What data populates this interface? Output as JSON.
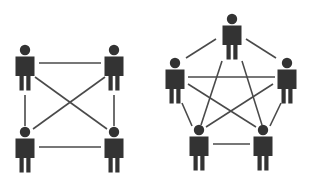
{
  "diagram": {
    "colors": {
      "figure": "#333333",
      "link": "#4a4a4a",
      "background": "#ffffff"
    },
    "groups": [
      {
        "name": "four-person-network",
        "nodes": [
          {
            "id": "A",
            "head_cx": 25,
            "head_cy": 50,
            "position": "top-left"
          },
          {
            "id": "B",
            "head_cx": 114,
            "head_cy": 50,
            "position": "top-right"
          },
          {
            "id": "C",
            "head_cx": 25,
            "head_cy": 132,
            "position": "bottom-left"
          },
          {
            "id": "D",
            "head_cx": 114,
            "head_cy": 132,
            "position": "bottom-right"
          }
        ],
        "links": [
          {
            "from": "A",
            "to": "B",
            "x1": 39,
            "y1": 63,
            "x2": 101,
            "y2": 63
          },
          {
            "from": "C",
            "to": "D",
            "x1": 39,
            "y1": 147,
            "x2": 101,
            "y2": 147
          },
          {
            "from": "A",
            "to": "C",
            "x1": 25,
            "y1": 95,
            "x2": 25,
            "y2": 126
          },
          {
            "from": "B",
            "to": "D",
            "x1": 114,
            "y1": 95,
            "x2": 114,
            "y2": 126
          },
          {
            "from": "A",
            "to": "D",
            "x1": 35,
            "y1": 77,
            "x2": 107,
            "y2": 129
          },
          {
            "from": "B",
            "to": "C",
            "x1": 105,
            "y1": 77,
            "x2": 33,
            "y2": 129
          }
        ]
      },
      {
        "name": "five-person-network",
        "nodes": [
          {
            "id": "P1",
            "head_cx": 232,
            "head_cy": 19,
            "position": "top"
          },
          {
            "id": "P2",
            "head_cx": 175,
            "head_cy": 63,
            "position": "left"
          },
          {
            "id": "P3",
            "head_cx": 287,
            "head_cy": 63,
            "position": "right"
          },
          {
            "id": "P4",
            "head_cx": 199,
            "head_cy": 130,
            "position": "bottom-left"
          },
          {
            "id": "P5",
            "head_cx": 263,
            "head_cy": 130,
            "position": "bottom-right"
          }
        ],
        "links": [
          {
            "from": "P1",
            "to": "P2",
            "x1": 216,
            "y1": 39,
            "x2": 186,
            "y2": 58
          },
          {
            "from": "P1",
            "to": "P3",
            "x1": 246,
            "y1": 39,
            "x2": 276,
            "y2": 58
          },
          {
            "from": "P2",
            "to": "P3",
            "x1": 188,
            "y1": 77,
            "x2": 275,
            "y2": 77
          },
          {
            "from": "P1",
            "to": "P4",
            "x1": 222,
            "y1": 61,
            "x2": 201,
            "y2": 125
          },
          {
            "from": "P1",
            "to": "P5",
            "x1": 242,
            "y1": 61,
            "x2": 262,
            "y2": 125
          },
          {
            "from": "P2",
            "to": "P5",
            "x1": 188,
            "y1": 84,
            "x2": 256,
            "y2": 127
          },
          {
            "from": "P3",
            "to": "P4",
            "x1": 273,
            "y1": 84,
            "x2": 206,
            "y2": 127
          },
          {
            "from": "P2",
            "to": "P4",
            "x1": 182,
            "y1": 103,
            "x2": 192,
            "y2": 126
          },
          {
            "from": "P3",
            "to": "P5",
            "x1": 281,
            "y1": 103,
            "x2": 270,
            "y2": 126
          },
          {
            "from": "P4",
            "to": "P5",
            "x1": 213,
            "y1": 144,
            "x2": 250,
            "y2": 144
          }
        ]
      }
    ]
  }
}
